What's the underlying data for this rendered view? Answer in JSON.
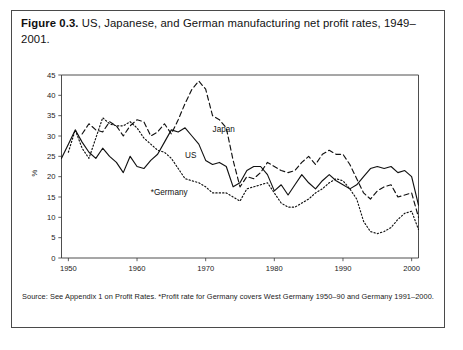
{
  "figure": {
    "number_label": "Figure 0.3.",
    "caption": " US, Japanese, and German manufacturing net profit rates, 1949–2001.",
    "source_note": "Source: See Appendix 1 on Profit Rates. *Profit rate for Germany covers West Germany 1950–90 and Germany 1991–2000."
  },
  "chart_data": {
    "type": "line",
    "title": "US, Japanese, and German manufacturing net profit rates, 1949–2001",
    "xlabel": "",
    "ylabel": "%",
    "xlim": [
      1949,
      2001
    ],
    "ylim": [
      0,
      45
    ],
    "ytick_values": [
      0,
      5,
      10,
      15,
      20,
      25,
      30,
      35,
      40,
      45
    ],
    "ytick_labels": [
      "0",
      "5",
      "10",
      "15",
      "20",
      "25",
      "30",
      "35",
      "40",
      "45"
    ],
    "xtick_values": [
      1950,
      1960,
      1970,
      1980,
      1990,
      2000
    ],
    "xtick_labels": [
      "1950",
      "1960",
      "1970",
      "1980",
      "1990",
      "2000"
    ],
    "grid": false,
    "legend_position": "inline-annotations",
    "x": [
      1949,
      1950,
      1951,
      1952,
      1953,
      1954,
      1955,
      1956,
      1957,
      1958,
      1959,
      1960,
      1961,
      1962,
      1963,
      1964,
      1965,
      1966,
      1967,
      1968,
      1969,
      1970,
      1971,
      1972,
      1973,
      1974,
      1975,
      1976,
      1977,
      1978,
      1979,
      1980,
      1981,
      1982,
      1983,
      1984,
      1985,
      1986,
      1987,
      1988,
      1989,
      1990,
      1991,
      1992,
      1993,
      1994,
      1995,
      1996,
      1997,
      1998,
      1999,
      2000,
      2001
    ],
    "series": [
      {
        "name": "US",
        "label": "US",
        "style": "solid",
        "values": [
          24.5,
          28.0,
          31.5,
          28.5,
          26.0,
          24.5,
          27.0,
          25.0,
          23.5,
          21.0,
          25.0,
          22.5,
          22.0,
          24.0,
          25.5,
          28.5,
          31.5,
          31.0,
          32.0,
          30.0,
          28.0,
          24.0,
          23.0,
          23.5,
          22.5,
          17.5,
          18.5,
          21.5,
          22.5,
          22.5,
          20.5,
          16.5,
          18.0,
          15.5,
          18.0,
          20.5,
          18.5,
          17.0,
          19.0,
          20.5,
          19.0,
          18.0,
          17.0,
          18.0,
          20.0,
          22.0,
          22.5,
          22.0,
          22.5,
          21.0,
          21.5,
          20.0,
          13.0
        ]
      },
      {
        "name": "Japan",
        "label": "Japan",
        "style": "dashed",
        "values": [
          null,
          null,
          null,
          30.5,
          33.0,
          31.5,
          31.0,
          33.5,
          32.5,
          30.0,
          32.5,
          34.0,
          33.5,
          30.0,
          31.0,
          33.0,
          30.5,
          34.0,
          38.0,
          41.5,
          43.5,
          41.5,
          35.0,
          34.0,
          32.0,
          24.0,
          17.5,
          20.0,
          19.5,
          21.0,
          23.5,
          22.5,
          21.5,
          21.0,
          21.5,
          23.5,
          25.0,
          23.0,
          25.5,
          26.5,
          25.5,
          25.5,
          23.0,
          19.5,
          16.0,
          14.5,
          16.5,
          17.5,
          18.0,
          15.0,
          15.5,
          16.0,
          10.0
        ]
      },
      {
        "name": "Germany",
        "label": "*Germany",
        "style": "dotted",
        "values": [
          null,
          26.0,
          31.5,
          27.0,
          24.5,
          29.5,
          34.5,
          33.0,
          32.5,
          32.5,
          33.5,
          32.0,
          29.5,
          28.0,
          26.5,
          26.0,
          24.5,
          22.0,
          19.5,
          19.0,
          18.5,
          17.5,
          16.0,
          16.0,
          16.0,
          15.0,
          14.0,
          17.0,
          17.5,
          18.0,
          18.5,
          16.0,
          13.5,
          12.5,
          12.5,
          13.5,
          14.5,
          16.0,
          17.0,
          18.5,
          19.5,
          19.0,
          17.0,
          14.5,
          9.0,
          6.5,
          6.0,
          6.5,
          7.5,
          9.5,
          11.0,
          11.5,
          7.0
        ]
      }
    ],
    "annotations": [
      {
        "text": "Japan",
        "x": 1971,
        "y": 31.0
      },
      {
        "text": "US",
        "x": 1967,
        "y": 24.5
      },
      {
        "text": "*Germany",
        "x": 1962,
        "y": 15.5
      }
    ]
  }
}
